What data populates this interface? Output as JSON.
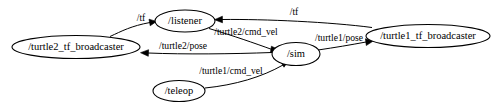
{
  "graph": {
    "title": "ROS computation graph",
    "background_color": "#ffffff",
    "node_stroke_color": "#000000",
    "edge_stroke_color": "#000000",
    "nodes": [
      {
        "id": "turtle2_tf_broadcaster",
        "label": "/turtle2_tf_broadcaster",
        "cx": 76,
        "cy": 47,
        "rx": 64,
        "ry": 11.5
      },
      {
        "id": "listener",
        "label": "/listener",
        "cx": 185,
        "cy": 21,
        "rx": 30,
        "ry": 11
      },
      {
        "id": "sim",
        "label": "/sim",
        "cx": 296,
        "cy": 54,
        "rx": 24,
        "ry": 11.5
      },
      {
        "id": "turtle1_tf_broadcaster",
        "label": "/turtle1_tf_broadcaster",
        "cx": 428,
        "cy": 36,
        "rx": 62,
        "ry": 11.5
      },
      {
        "id": "teleop",
        "label": "/teleop",
        "cx": 179,
        "cy": 91,
        "rx": 26,
        "ry": 10.5
      }
    ],
    "edges": [
      {
        "id": "tf-turtle2-to-listener",
        "label": "/tf",
        "from": "turtle2_tf_broadcaster",
        "to": "listener",
        "label_x": 141,
        "label_y": 19
      },
      {
        "id": "turtle2-cmd-vel",
        "label": "/turtle2/cmd_vel",
        "from": "listener",
        "to": "sim",
        "label_x": 246,
        "label_y": 33
      },
      {
        "id": "turtle2-pose",
        "label": "/turtle2/pose",
        "from": "sim",
        "to": "turtle2_tf_broadcaster",
        "label_x": 183,
        "label_y": 47
      },
      {
        "id": "tf-turtle1-to-listener",
        "label": "/tf",
        "from": "turtle1_tf_broadcaster",
        "to": "listener",
        "label_x": 294,
        "label_y": 13
      },
      {
        "id": "turtle1-pose",
        "label": "/turtle1/pose",
        "from": "sim",
        "to": "turtle1_tf_broadcaster",
        "label_x": 339,
        "label_y": 39
      },
      {
        "id": "turtle1-cmd-vel",
        "label": "/turtle1/cmd_vel",
        "from": "teleop",
        "to": "sim",
        "label_x": 231,
        "label_y": 72
      }
    ]
  }
}
